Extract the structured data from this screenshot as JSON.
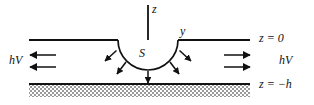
{
  "figure": {
    "type": "diagram",
    "background_color": "#ffffff",
    "line_color": "#111111",
    "width": 314,
    "height": 105
  },
  "axes": {
    "vertical_axis_label": "z",
    "horizontal_axis_label": "y",
    "origin_x": 148,
    "surface_y": 40
  },
  "source": {
    "label": "S",
    "shape": "hemisphere",
    "center_x": 148,
    "center_y": 40,
    "radius": 30,
    "radiating_arrow_count": 5
  },
  "boundaries": [
    {
      "name": "top-surface",
      "label": "z = 0",
      "y": 40,
      "x_start": 29,
      "x_end": 250,
      "hatched": false
    },
    {
      "name": "bottom-surface",
      "label": "z = −h",
      "y": 84,
      "x_start": 29,
      "x_end": 250,
      "hatched": true
    }
  ],
  "flux": {
    "left_label": "hV",
    "right_label": "hV",
    "left_arrow_direction": "left",
    "right_arrow_direction": "right",
    "arrow_rows_y": [
      55,
      67
    ]
  },
  "colors": {
    "ink": "#111111",
    "hatch": "#8a8a8a",
    "paper": "#ffffff"
  }
}
